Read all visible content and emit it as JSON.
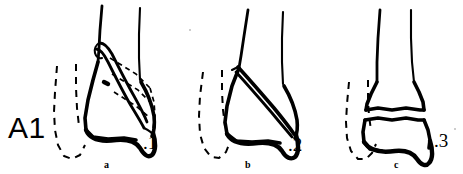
{
  "figure": {
    "group_label": "A1",
    "background_color": "#ffffff",
    "ink_color": "#000000",
    "panels": [
      {
        "letter": "a",
        "number_label": ".1",
        "name": "panel-a-lateral-malleolus-avulsion"
      },
      {
        "letter": "b",
        "number_label": ".2",
        "name": "panel-b-oblique-fibula-fracture"
      },
      {
        "letter": "c",
        "number_label": ".3",
        "name": "panel-c-transverse-fibula-fracture"
      }
    ]
  }
}
